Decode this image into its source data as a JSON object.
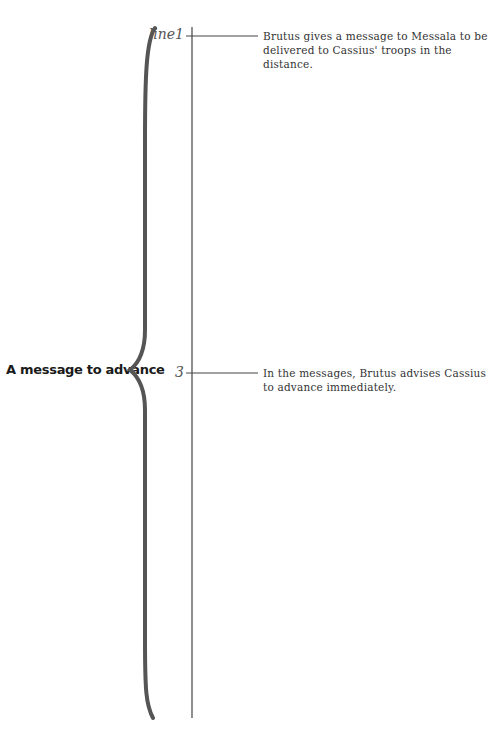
{
  "diagram": {
    "topic": "A message to advance",
    "markers": [
      {
        "label": "line1",
        "note": "Brutus gives a message to Messala to be delivered to Cassius' troops in the distance."
      },
      {
        "label": "3",
        "note": "In the messages, Brutus advises Cassius to advance immediately."
      }
    ]
  },
  "colors": {
    "brace": "#555555",
    "line": "#444444",
    "text": "#333333"
  }
}
